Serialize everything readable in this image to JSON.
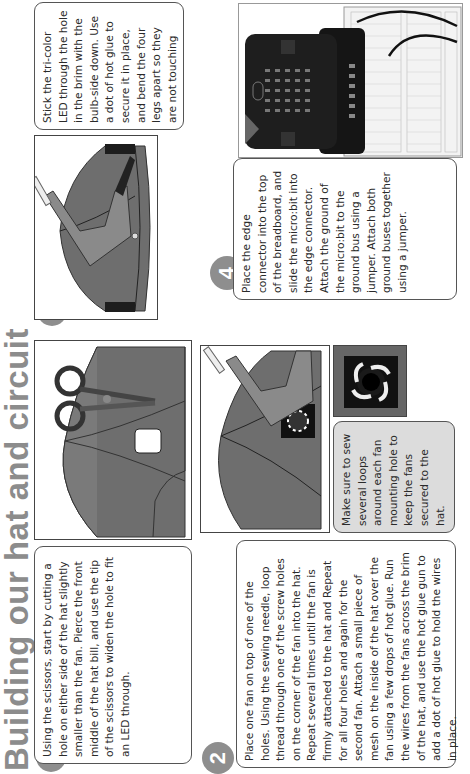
{
  "page": {
    "title": "Building our hat and circuit",
    "orientation": "rotated 90° counterclockwise",
    "title_color": "#8c8c8c",
    "badge_color": "#8e8e8e"
  },
  "steps": [
    {
      "number": "1",
      "text": "Using the scissors, start by cutting a hole on either side of the hat slightly smaller than the fan. Pierce the front middle of the hat bill, and use the tip of the scissors to widen the hole to fit an LED through.",
      "image": "scissors-cutting-hat-illustration"
    },
    {
      "number": "2",
      "text": "Place one fan on top of one of the holes. Using the sewing needle, loop thread through one of the screw holes on the corner of the fan into the hat. Repeat several times until the fan is firmly attached to the hat and Repeat for all four holes and again for the second fan. Attach a small piece of mesh on the inside of the hat over the fan using a few drops of hot glue. Run the wires from the fans across the brim of the hat, and use the hot glue gun to add a dot of hot glue to hold the wires in place.",
      "note": "Make sure to sew several loops around each fan mounting hole to keep the fans secured to the hat.",
      "image": "glue-gun-fan-on-hat-illustration",
      "detail_image": "fan-closeup-illustration"
    },
    {
      "number": "3",
      "text": "Stick the tri-color LED through the hole in the brim with the bulb-side down. Use a dot of hot glue to secure it in place, and bend the four legs apart so they are not touching",
      "image": "glue-gun-led-on-brim-illustration"
    },
    {
      "number": "4",
      "text": "Place the edge connector into the top of the breadboard, and slide the micro:bit into the edge connector. Attach the ground of the micro:bit to the ground bus using a jumper. Attach both ground buses together using a jumper.",
      "image": "microbit-breadboard-diagram"
    }
  ]
}
